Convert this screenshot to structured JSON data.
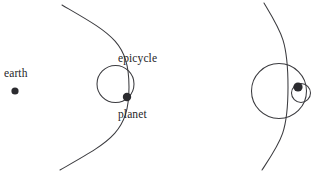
{
  "figure": {
    "background_color": "#ffffff",
    "stroke_color": "#3b3b3f",
    "dot_color": "#2b2b2f",
    "width": 322,
    "height": 173
  },
  "labels": {
    "earth": "earth",
    "epicycle": "epicycle",
    "planet": "planet"
  },
  "panels": [
    {
      "name": "left-panel",
      "description": "Earth at left, large deferent arc, epicycle circle with planet on it",
      "elements": {
        "earth_dot": {
          "cx": 15,
          "cy": 91,
          "r": 3.6
        },
        "deferent_arc": {
          "start_x": 62,
          "start_y": 5,
          "end_x": 60,
          "end_y": 170,
          "bulge_x": 129,
          "bulge_y": 87
        },
        "epicycle_circle": {
          "cx": 115.5,
          "cy": 84,
          "r": 18.5
        },
        "planet_dot": {
          "cx": 127,
          "cy": 97,
          "r": 4.2
        }
      }
    },
    {
      "name": "right-panel",
      "description": "Flatter deferent arc, large epicycle circle, small secondary circle with planet dot",
      "elements": {
        "deferent_arc": {
          "start_x": 264,
          "start_y": 3,
          "end_x": 262,
          "end_y": 170,
          "bulge_x": 288,
          "bulge_y": 87
        },
        "epicycle_circle": {
          "cx": 279,
          "cy": 91,
          "r": 27.5
        },
        "secondary_circle": {
          "cx": 301,
          "cy": 93,
          "r": 9.5
        },
        "planet_dot": {
          "cx": 298,
          "cy": 87,
          "r": 4.6
        }
      }
    }
  ]
}
